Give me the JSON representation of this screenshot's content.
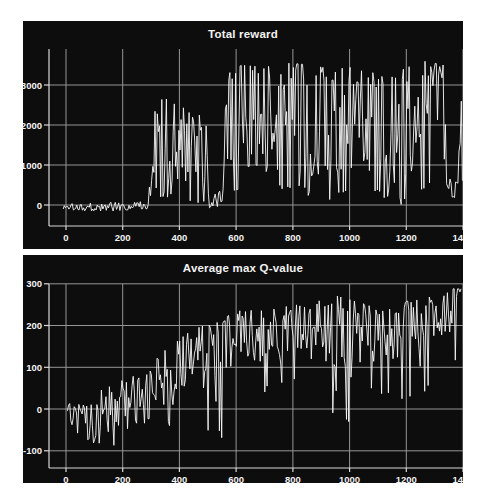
{
  "style": {
    "page_bg": "#ffffff",
    "panel_bg": "#0d0d0d",
    "grid_color": "#969696",
    "axis_color": "#d8d8d8",
    "line_color": "#f7f7f7",
    "text_color": "#f2f2f2"
  },
  "chart_data": [
    {
      "type": "line",
      "title": "Total reward",
      "xlabel": "",
      "ylabel": "",
      "xlim": [
        -60,
        1400
      ],
      "ylim": [
        -525,
        3900
      ],
      "xticks": [
        0,
        200,
        400,
        600,
        800,
        1000,
        1200,
        1400
      ],
      "yticks": [
        0,
        1000,
        2000,
        3000
      ],
      "grid": true,
      "legend": null,
      "series": [
        {
          "name": "episode total reward",
          "x_start": -10,
          "x_end": 1400,
          "x_step": 4,
          "seed": 1337,
          "drop_p": 0.13,
          "peak_p": 0.12,
          "spread": 0.95,
          "envelope": [
            [
              -10,
              -130,
              60,
              0.45
            ],
            [
              140,
              -160,
              80,
              0.45
            ],
            [
              285,
              -110,
              90,
              0.5
            ],
            [
              300,
              -60,
              2700,
              0.5
            ],
            [
              340,
              -60,
              2950,
              0.55
            ],
            [
              420,
              -20,
              2500,
              0.5
            ],
            [
              460,
              0,
              2300,
              0.45
            ],
            [
              500,
              -60,
              2100,
              0.4
            ],
            [
              505,
              -90,
              550,
              0.3
            ],
            [
              550,
              -60,
              450,
              0.3
            ],
            [
              565,
              100,
              3250,
              0.65
            ],
            [
              620,
              250,
              3500,
              0.7
            ],
            [
              700,
              150,
              3450,
              0.65
            ],
            [
              780,
              200,
              3550,
              0.7
            ],
            [
              860,
              100,
              3500,
              0.65
            ],
            [
              940,
              50,
              3400,
              0.6
            ],
            [
              1020,
              150,
              3450,
              0.65
            ],
            [
              1100,
              50,
              3350,
              0.6
            ],
            [
              1180,
              -150,
              3400,
              0.6
            ],
            [
              1260,
              350,
              3600,
              0.75
            ],
            [
              1330,
              250,
              3500,
              0.7
            ],
            [
              1345,
              150,
              850,
              0.4
            ],
            [
              1380,
              200,
              800,
              0.35
            ],
            [
              1388,
              300,
              3300,
              0.85
            ],
            [
              1400,
              500,
              3300,
              0.8
            ]
          ]
        }
      ]
    },
    {
      "type": "line",
      "title": "Average max Q-value",
      "xlabel": "",
      "ylabel": "",
      "xlim": [
        -60,
        1400
      ],
      "ylim": [
        -141,
        300
      ],
      "xticks": [
        0,
        200,
        400,
        600,
        800,
        1000,
        1200,
        1400
      ],
      "yticks": [
        -100,
        0,
        100,
        200,
        300
      ],
      "grid": true,
      "legend": null,
      "series": [
        {
          "name": "average max Q-value per episode",
          "x_start": 5,
          "x_end": 1395,
          "x_step": 4,
          "seed": 424,
          "drop_p": 0.08,
          "peak_p": 0.1,
          "spread": 0.75,
          "envelope": [
            [
              5,
              -25,
              15,
              0.55
            ],
            [
              40,
              -60,
              15,
              0.5
            ],
            [
              80,
              -95,
              10,
              0.45
            ],
            [
              100,
              -115,
              25,
              0.5
            ],
            [
              130,
              -65,
              50,
              0.55
            ],
            [
              165,
              -130,
              60,
              0.55
            ],
            [
              200,
              -45,
              75,
              0.6
            ],
            [
              250,
              -75,
              95,
              0.6
            ],
            [
              300,
              -25,
              115,
              0.62
            ],
            [
              350,
              -35,
              145,
              0.62
            ],
            [
              400,
              -75,
              170,
              0.65
            ],
            [
              450,
              -25,
              190,
              0.65
            ],
            [
              500,
              -65,
              205,
              0.68
            ],
            [
              550,
              -75,
              215,
              0.68
            ],
            [
              600,
              15,
              235,
              0.7
            ],
            [
              650,
              55,
              248,
              0.72
            ],
            [
              700,
              35,
              242,
              0.7
            ],
            [
              750,
              45,
              238,
              0.7
            ],
            [
              800,
              55,
              252,
              0.72
            ],
            [
              850,
              25,
              242,
              0.7
            ],
            [
              900,
              55,
              282,
              0.72
            ],
            [
              950,
              -60,
              272,
              0.68
            ],
            [
              1000,
              -45,
              262,
              0.7
            ],
            [
              1050,
              55,
              252,
              0.72
            ],
            [
              1100,
              35,
              248,
              0.7
            ],
            [
              1150,
              25,
              252,
              0.7
            ],
            [
              1200,
              5,
              258,
              0.7
            ],
            [
              1250,
              15,
              262,
              0.72
            ],
            [
              1300,
              75,
              272,
              0.75
            ],
            [
              1350,
              95,
              288,
              0.78
            ],
            [
              1395,
              115,
              288,
              0.8
            ]
          ]
        }
      ]
    }
  ]
}
